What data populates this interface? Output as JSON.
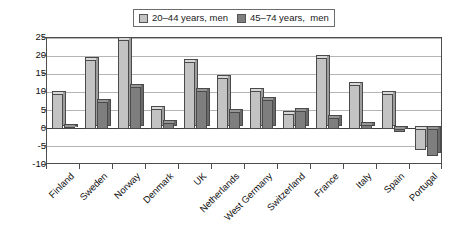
{
  "chart_data": {
    "type": "bar",
    "title": "",
    "subtitle": "",
    "xlabel": "",
    "ylabel": "",
    "ylim": [
      -10,
      25
    ],
    "yticks": [
      25,
      20,
      15,
      10,
      5,
      0,
      -5,
      -10
    ],
    "ytick_labels": [
      "25",
      "20",
      "15",
      "10",
      "5",
      "0",
      "-5",
      "-10"
    ],
    "grid": true,
    "legend_position": "top-center",
    "categories": [
      "Finland",
      "Sweden",
      "Norway",
      "Denmark",
      "UK",
      "Netherlands",
      "West Germany",
      "Switzerland",
      "France",
      "Italy",
      "Spain",
      "Portugal"
    ],
    "series": [
      {
        "name": "20–44 years, men",
        "color": "#c3c3c3",
        "values": [
          9.5,
          19,
          24.5,
          5.5,
          18.5,
          14,
          10.5,
          4,
          19.5,
          12,
          9.5,
          -6
        ]
      },
      {
        "name": "45–74 years,  men",
        "color": "#7e7e7e",
        "values": [
          0.5,
          7.5,
          11.5,
          1.5,
          10.5,
          4.5,
          8,
          5,
          3,
          1,
          -1,
          -7.5
        ]
      }
    ]
  },
  "legend": {
    "entries": [
      {
        "label": "20–44 years, men",
        "swatch": "light-gray-swatch"
      },
      {
        "label": "45–74 years,  men",
        "swatch": "dark-gray-swatch"
      }
    ]
  }
}
